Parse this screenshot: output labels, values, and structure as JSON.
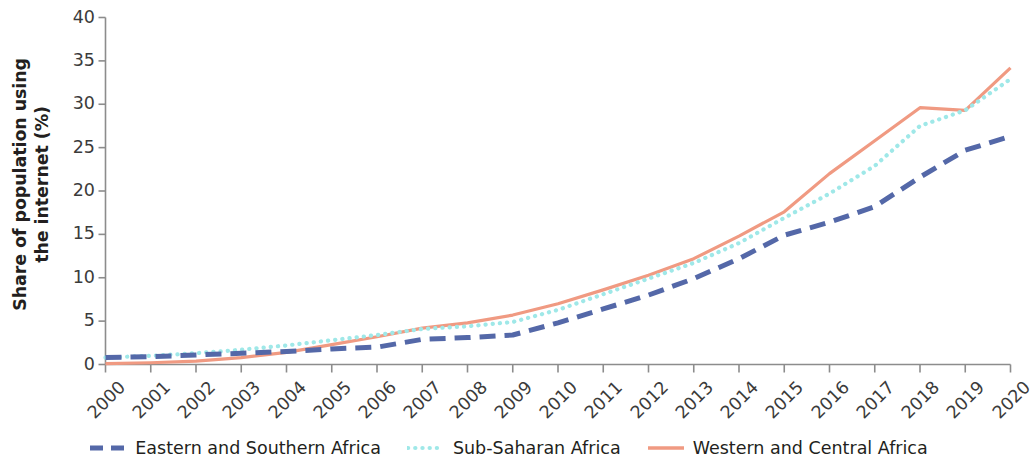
{
  "chart_data": {
    "type": "line",
    "title": "",
    "xlabel": "",
    "ylabel": "Share of population using\nthe internet (%)",
    "ylabel_line1": "Share of population using",
    "ylabel_line2": "the internet (%)",
    "x": [
      2000,
      2001,
      2002,
      2003,
      2004,
      2005,
      2006,
      2007,
      2008,
      2009,
      2010,
      2011,
      2012,
      2013,
      2014,
      2015,
      2016,
      2017,
      2018,
      2019,
      2020
    ],
    "categories": [
      "2000",
      "2001",
      "2002",
      "2003",
      "2004",
      "2005",
      "2006",
      "2007",
      "2008",
      "2009",
      "2010",
      "2011",
      "2012",
      "2013",
      "2014",
      "2015",
      "2016",
      "2017",
      "2018",
      "2019",
      "2020"
    ],
    "xlim": [
      2000,
      2020
    ],
    "ylim": [
      0,
      40
    ],
    "yticks": [
      0,
      5,
      10,
      15,
      20,
      25,
      30,
      35,
      40
    ],
    "ytick_labels": [
      "0",
      "5",
      "10",
      "15",
      "20",
      "25",
      "30",
      "35",
      "40"
    ],
    "grid": false,
    "legend_position": "bottom-center",
    "series": [
      {
        "name": "Eastern and Southern Africa",
        "color": "#5468a8",
        "style": "dashed",
        "values": [
          0.8,
          0.9,
          1.1,
          1.3,
          1.5,
          1.8,
          2.0,
          2.9,
          3.1,
          3.4,
          4.8,
          6.4,
          8.0,
          9.9,
          12.2,
          14.9,
          16.4,
          18.2,
          21.6,
          24.7,
          26.3
        ]
      },
      {
        "name": "Sub-Saharan Africa",
        "color": "#9fe8e8",
        "style": "dotted",
        "values": [
          0.8,
          1.0,
          1.3,
          1.7,
          2.2,
          2.8,
          3.4,
          4.1,
          4.4,
          4.9,
          6.3,
          8.1,
          9.9,
          11.7,
          14.0,
          16.9,
          19.7,
          22.9,
          27.5,
          29.3,
          32.9
        ]
      },
      {
        "name": "Western and Central Africa",
        "color": "#f09a82",
        "style": "solid",
        "values": [
          0.1,
          0.2,
          0.4,
          0.8,
          1.4,
          2.3,
          3.2,
          4.2,
          4.8,
          5.7,
          7.0,
          8.6,
          10.3,
          12.2,
          14.8,
          17.6,
          22.0,
          25.8,
          29.6,
          29.3,
          34.2
        ]
      }
    ]
  },
  "legend": {
    "items": [
      {
        "label": "Eastern and Southern Africa",
        "color": "#5468a8",
        "style": "dashed"
      },
      {
        "label": "Sub-Saharan Africa",
        "color": "#9fe8e8",
        "style": "dotted"
      },
      {
        "label": "Western and Central Africa",
        "color": "#f09a82",
        "style": "solid"
      }
    ]
  },
  "axis": {
    "color": "#8c8c8c",
    "tick_color": "#8c8c8c"
  }
}
